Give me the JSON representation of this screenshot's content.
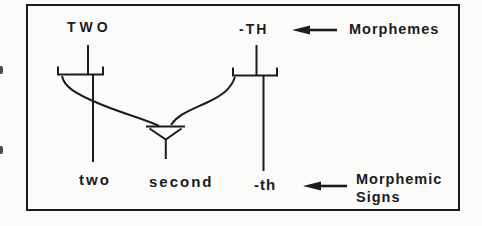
{
  "colors": {
    "ink": "#1c1c1c",
    "paper": "#fbfbf9"
  },
  "diagram": {
    "morphemes": {
      "left": "TWO",
      "right": "-TH"
    },
    "morphemes_row_label": "Morphemes",
    "signs": {
      "left": "two",
      "center": "second",
      "right": "-th"
    },
    "signs_row_label_line1": "Morphemic",
    "signs_row_label_line2": "Signs",
    "icons": {
      "top_arrow": "left-arrow-icon",
      "bottom_arrow": "left-arrow-icon",
      "merge": "merge-triangle-icon"
    }
  }
}
